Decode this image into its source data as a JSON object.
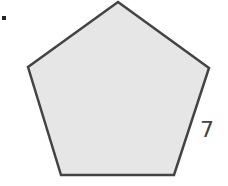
{
  "diagram": {
    "shape": "regular-pentagon",
    "vertices": [
      [
        118,
        2
      ],
      [
        209,
        68
      ],
      [
        174,
        175
      ],
      [
        61,
        175
      ],
      [
        28,
        67
      ]
    ],
    "fill_color": "#e6e6e6",
    "stroke_color": "#444444",
    "side_label": "7",
    "bullet": "•"
  }
}
